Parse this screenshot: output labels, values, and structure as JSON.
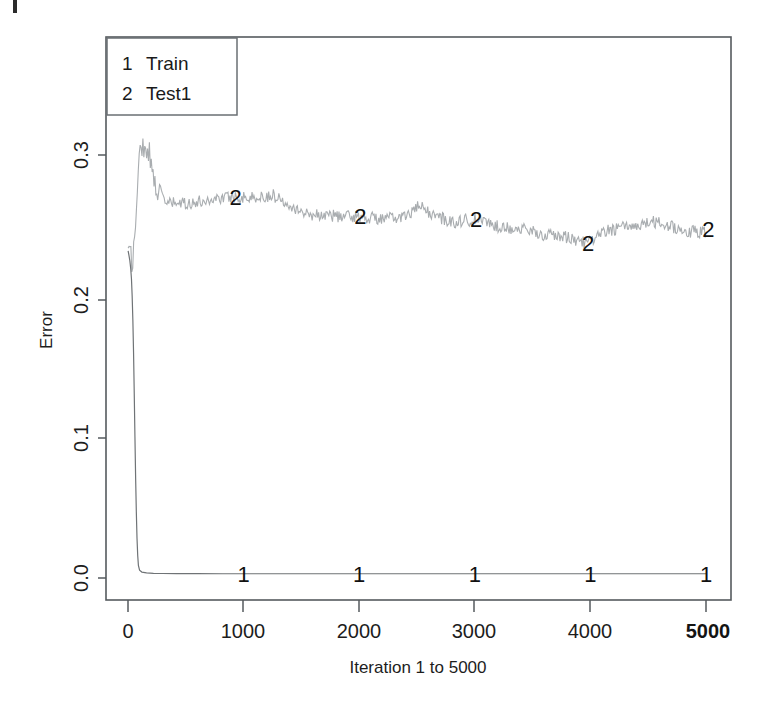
{
  "figure": {
    "background": "#ffffff",
    "frame_color": "#555a5e",
    "artifact_name": "scan-edge-mark"
  },
  "chart_data": {
    "type": "line",
    "title": "",
    "xlabel": "Iteration 1 to 5000",
    "ylabel": "Error",
    "xlim": [
      -260,
      5300
    ],
    "ylim": [
      -0.0155,
      0.3455
    ],
    "xticks": [
      0,
      1000,
      2000,
      3000,
      4000,
      5000
    ],
    "xtick_labels": [
      "0",
      "1000",
      "2000",
      "3000",
      "4000",
      "5000"
    ],
    "xtick_bold": [
      false,
      false,
      false,
      false,
      false,
      true
    ],
    "yticks": [
      0.0,
      0.1,
      0.2,
      0.3
    ],
    "ytick_labels": [
      "0.0",
      "0.1",
      "0.2",
      "0.3"
    ],
    "grid": false,
    "legend_position": "top-left",
    "legend_entries": [
      {
        "symbol": "1",
        "label": "Train"
      },
      {
        "symbol": "2",
        "label": "Test1"
      }
    ],
    "series": [
      {
        "name": "Train",
        "symbol": "1",
        "color": "#6f7376",
        "marker_x": [
          1000,
          2000,
          3000,
          4000,
          5000
        ],
        "marker_y": [
          0.003,
          0.003,
          0.003,
          0.003,
          0.003
        ],
        "x": [
          1,
          8,
          16,
          24,
          30,
          36,
          42,
          48,
          54,
          60,
          66,
          72,
          78,
          84,
          90,
          100,
          120,
          160,
          220,
          300,
          420,
          600,
          820,
          1000,
          1300,
          1700,
          2000,
          2400,
          2800,
          3000,
          3400,
          3800,
          4000,
          4400,
          4800,
          5000
        ],
        "y": [
          0.232,
          0.229,
          0.225,
          0.219,
          0.212,
          0.2,
          0.183,
          0.16,
          0.131,
          0.1,
          0.071,
          0.047,
          0.028,
          0.016,
          0.009,
          0.0055,
          0.0042,
          0.0036,
          0.0033,
          0.0032,
          0.0031,
          0.0031,
          0.003,
          0.003,
          0.003,
          0.003,
          0.003,
          0.003,
          0.003,
          0.003,
          0.003,
          0.003,
          0.003,
          0.003,
          0.003,
          0.003
        ]
      },
      {
        "name": "Test1",
        "symbol": "2",
        "color": "#a9adb0",
        "marker_x": [
          930,
          2010,
          3010,
          3980,
          5020
        ],
        "marker_y": [
          0.2705,
          0.2565,
          0.2545,
          0.2375,
          0.2475
        ],
        "x_start": 1,
        "x_end": 5000,
        "baseline_note": "noisy curve: starts ~0.23, spikes to ~0.315 near iteration 110, decays to ~0.26 by 600, slow drift down to ~0.245 at 5000",
        "key_points": [
          {
            "x": 1,
            "y": 0.23
          },
          {
            "x": 40,
            "y": 0.225
          },
          {
            "x": 70,
            "y": 0.256
          },
          {
            "x": 95,
            "y": 0.293
          },
          {
            "x": 110,
            "y": 0.315
          },
          {
            "x": 135,
            "y": 0.302
          },
          {
            "x": 170,
            "y": 0.308
          },
          {
            "x": 210,
            "y": 0.287
          },
          {
            "x": 260,
            "y": 0.277
          },
          {
            "x": 330,
            "y": 0.266
          },
          {
            "x": 450,
            "y": 0.2655
          },
          {
            "x": 600,
            "y": 0.2665
          },
          {
            "x": 780,
            "y": 0.2695
          },
          {
            "x": 930,
            "y": 0.2705
          },
          {
            "x": 1100,
            "y": 0.2695
          },
          {
            "x": 1250,
            "y": 0.2715
          },
          {
            "x": 1400,
            "y": 0.2655
          },
          {
            "x": 1520,
            "y": 0.2585
          },
          {
            "x": 1700,
            "y": 0.2575
          },
          {
            "x": 1850,
            "y": 0.2565
          },
          {
            "x": 2010,
            "y": 0.2565
          },
          {
            "x": 2200,
            "y": 0.2545
          },
          {
            "x": 2400,
            "y": 0.2565
          },
          {
            "x": 2520,
            "y": 0.2635
          },
          {
            "x": 2640,
            "y": 0.2575
          },
          {
            "x": 2800,
            "y": 0.2525
          },
          {
            "x": 3010,
            "y": 0.2545
          },
          {
            "x": 3200,
            "y": 0.2495
          },
          {
            "x": 3400,
            "y": 0.2475
          },
          {
            "x": 3600,
            "y": 0.2435
          },
          {
            "x": 3800,
            "y": 0.2415
          },
          {
            "x": 3980,
            "y": 0.2375
          },
          {
            "x": 4150,
            "y": 0.2465
          },
          {
            "x": 4350,
            "y": 0.2495
          },
          {
            "x": 4550,
            "y": 0.2525
          },
          {
            "x": 4700,
            "y": 0.2495
          },
          {
            "x": 4850,
            "y": 0.2455
          },
          {
            "x": 5000,
            "y": 0.2455
          }
        ]
      }
    ]
  },
  "plot_geometry": {
    "frame_left": 106,
    "frame_top": 37,
    "frame_right": 731,
    "frame_bottom": 600,
    "x_zero_px": 128,
    "x_5000_px": 706,
    "y_0_px": 578,
    "y_03_px": 155
  }
}
